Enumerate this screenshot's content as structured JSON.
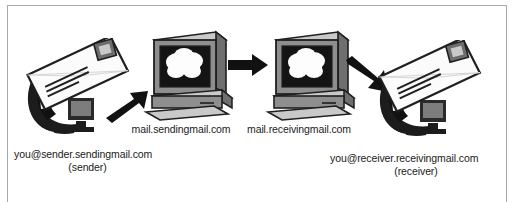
{
  "diagram": {
    "colors": {
      "frame_border": "#a8a8a8",
      "background": "#ffffff",
      "text": "#1a1a1a",
      "arrow": "#111111",
      "monitor_bezel": "#8e8e8e",
      "monitor_bezel_light": "#c9c9c9",
      "monitor_bezel_dark": "#5e5e5e",
      "screen": "#141414",
      "cloud": "#fdfdfd",
      "envelope_face": "#fbfbfb",
      "envelope_edge": "#1f1f1f",
      "dark_computer": "#1c1c1c",
      "stamp": "#6d6d6d"
    },
    "nodes": [
      {
        "id": "sender-endpoint",
        "icon": "envelope-over-computer",
        "address": "you@sender.sendingmail.com",
        "role": "(sender)"
      },
      {
        "id": "sending-server",
        "icon": "server-monitor-cloud",
        "label": "mail.sendingmail.com"
      },
      {
        "id": "receiving-server",
        "icon": "server-monitor-cloud",
        "label": "mail.receivingmail.com"
      },
      {
        "id": "receiver-endpoint",
        "icon": "envelope-over-computer",
        "address": "you@receiver.receivingmail.com",
        "role": "(receiver)"
      }
    ],
    "arrows": [
      {
        "id": "arrow-sender-to-sending-server",
        "direction": "up-right"
      },
      {
        "id": "arrow-sending-to-receiving-server",
        "direction": "right"
      },
      {
        "id": "arrow-receiving-server-to-receiver",
        "direction": "down-right"
      }
    ]
  }
}
